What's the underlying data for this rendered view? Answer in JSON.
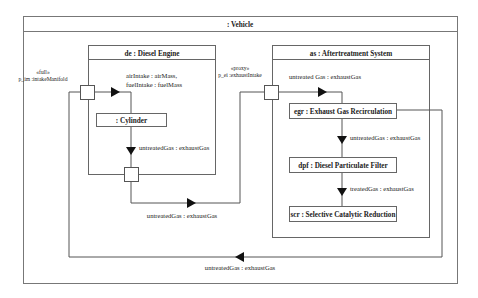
{
  "vehicle": {
    "title": ": Vehicle"
  },
  "diesel_engine": {
    "title": "de : Diesel Engine",
    "port": {
      "stereotype": "«full»",
      "label": "p_im :intakeManifold"
    },
    "intake_label_1": "airIntake : airMass,",
    "intake_label_2": "fuelIntake : fuelMass",
    "cylinder": ": Cylinder",
    "cylinder_out_label": "untreatedGas : exhaustGas",
    "out_label": "untreatedGas : exhaustGas"
  },
  "aftertreatment": {
    "title": "as : Aftertreatment System",
    "port": {
      "stereotype": "«proxy»",
      "label": "p_ei :exhaustIntake"
    },
    "in_label": "untreated Gas : exhaustGas",
    "egr": "egr : Exhaust Gas Recirculation",
    "egr_out_label": "untreatedGas : exhaustGas",
    "dpf": "dpf : Diesel Particulate Filter",
    "dpf_out_label": "treatedGas : exhaustGas",
    "scr": "scr : Selective Catalytic Reduction"
  },
  "recirculation_label": "untreatedGas : exhaustGas"
}
